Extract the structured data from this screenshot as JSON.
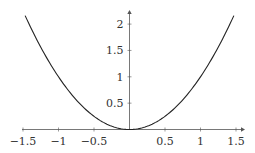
{
  "chart_data": {
    "type": "line",
    "title": "",
    "xlabel": "",
    "ylabel": "",
    "function": "y = x^2",
    "xlim": [
      -1.5,
      1.5
    ],
    "ylim": [
      0,
      2.25
    ],
    "grid": false,
    "legend": null,
    "x_ticks": [
      -1.5,
      -1,
      -0.5,
      0.5,
      1,
      1.5
    ],
    "x_tick_labels": [
      "−1.5",
      "−1",
      "−0.5",
      "0.5",
      "1",
      "1.5"
    ],
    "y_ticks": [
      0.5,
      1,
      1.5,
      2
    ],
    "y_tick_labels": [
      "0.5",
      "1",
      "1.5",
      "2"
    ],
    "series": [
      {
        "name": "x^2",
        "color": "#222222",
        "x": [
          -1.47,
          -1.25,
          -1.0,
          -0.75,
          -0.5,
          -0.25,
          0,
          0.25,
          0.5,
          0.75,
          1.0,
          1.25,
          1.47
        ],
        "y": [
          2.16,
          1.5625,
          1.0,
          0.5625,
          0.25,
          0.0625,
          0,
          0.0625,
          0.25,
          0.5625,
          1.0,
          1.5625,
          2.16
        ]
      }
    ]
  },
  "colors": {
    "axis": "#555555",
    "curve": "#222222",
    "text": "#333333"
  }
}
